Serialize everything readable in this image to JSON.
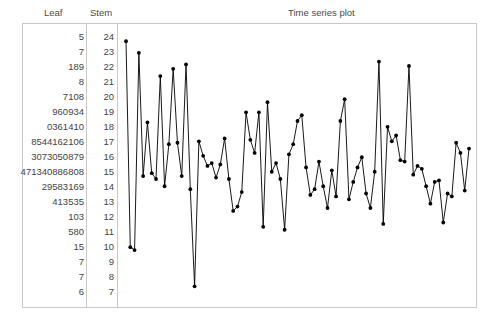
{
  "header": {
    "leaf_label": "Leaf",
    "stem_label": "Stem",
    "plot_title": "Time series plot"
  },
  "colors": {
    "frame": "#c8c8c8",
    "text": "#444444",
    "series": "#000000",
    "background": "#ffffff"
  },
  "stem_leaf": {
    "rows": [
      {
        "leaf": "5",
        "stem": "24"
      },
      {
        "leaf": "7",
        "stem": "23"
      },
      {
        "leaf": "189",
        "stem": "22"
      },
      {
        "leaf": "8",
        "stem": "21"
      },
      {
        "leaf": "7108",
        "stem": "20"
      },
      {
        "leaf": "960934",
        "stem": "19"
      },
      {
        "leaf": "0361410",
        "stem": "18"
      },
      {
        "leaf": "8544162106",
        "stem": "17"
      },
      {
        "leaf": "3073050879",
        "stem": "16"
      },
      {
        "leaf": "471340886808",
        "stem": "15"
      },
      {
        "leaf": "29583169",
        "stem": "14"
      },
      {
        "leaf": "413535",
        "stem": "13"
      },
      {
        "leaf": "103",
        "stem": "12"
      },
      {
        "leaf": "580",
        "stem": "11"
      },
      {
        "leaf": "15",
        "stem": "10"
      },
      {
        "leaf": "7",
        "stem": "9"
      },
      {
        "leaf": "7",
        "stem": "8"
      },
      {
        "leaf": "6",
        "stem": "7"
      }
    ]
  },
  "chart_data": {
    "type": "line",
    "title": "Time series plot",
    "xlabel": "",
    "ylabel": "",
    "grid": false,
    "legend": "none",
    "marker": "filled-circle",
    "ylim": [
      70,
      250
    ],
    "xlim": [
      1,
      81
    ],
    "x": [
      1,
      2,
      3,
      4,
      5,
      6,
      7,
      8,
      9,
      10,
      11,
      12,
      13,
      14,
      15,
      16,
      17,
      18,
      19,
      20,
      21,
      22,
      23,
      24,
      25,
      26,
      27,
      28,
      29,
      30,
      31,
      32,
      33,
      34,
      35,
      36,
      37,
      38,
      39,
      40,
      41,
      42,
      43,
      44,
      45,
      46,
      47,
      48,
      49,
      50,
      51,
      52,
      53,
      54,
      55,
      56,
      57,
      58,
      59,
      60,
      61,
      62,
      63,
      64,
      65,
      66,
      67,
      68,
      69,
      70,
      71,
      72,
      73,
      74,
      75,
      76,
      77,
      78,
      79,
      80,
      81
    ],
    "values": [
      245,
      103,
      101,
      237,
      152,
      189,
      154,
      150,
      221,
      145,
      174,
      226,
      175,
      152,
      229,
      143,
      76,
      176,
      166,
      159,
      161,
      151,
      160,
      178,
      150,
      128,
      131,
      141,
      196,
      177,
      168,
      196,
      117,
      203,
      155,
      161,
      150,
      115,
      167,
      174,
      190,
      194,
      158,
      139,
      143,
      162,
      145,
      130,
      156,
      138,
      190,
      205,
      136,
      148,
      158,
      165,
      140,
      130,
      155,
      231,
      119,
      186,
      176,
      180,
      163,
      162,
      228,
      153,
      159,
      157,
      145,
      133,
      148,
      149,
      120,
      140,
      138,
      175,
      168,
      142,
      171
    ]
  }
}
